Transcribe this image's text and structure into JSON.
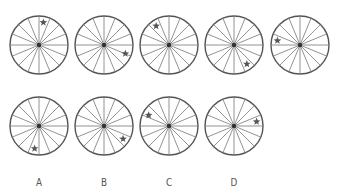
{
  "puzzle": {
    "spokes": 16,
    "radius": 29,
    "colors": {
      "rim": "#555555",
      "spoke": "#777777",
      "hub": "#333333",
      "star": "#555555",
      "label": "#555555"
    },
    "sequence": [
      {
        "id": "seq-1",
        "cx": 39,
        "cy": 45,
        "star_angle": 11
      },
      {
        "id": "seq-2",
        "cx": 104,
        "cy": 45,
        "star_angle": 112
      },
      {
        "id": "seq-3",
        "cx": 169,
        "cy": 45,
        "star_angle": 326
      },
      {
        "id": "seq-4",
        "cx": 234,
        "cy": 45,
        "star_angle": 146
      },
      {
        "id": "seq-5",
        "cx": 300,
        "cy": 45,
        "star_angle": 281
      }
    ],
    "options": [
      {
        "label": "A",
        "cx": 39,
        "cy": 126,
        "star_angle": 191
      },
      {
        "label": "B",
        "cx": 104,
        "cy": 126,
        "star_angle": 124
      },
      {
        "label": "C",
        "cx": 169,
        "cy": 126,
        "star_angle": 298
      },
      {
        "label": "D",
        "cx": 234,
        "cy": 126,
        "star_angle": 79
      }
    ],
    "label_y": 176
  }
}
